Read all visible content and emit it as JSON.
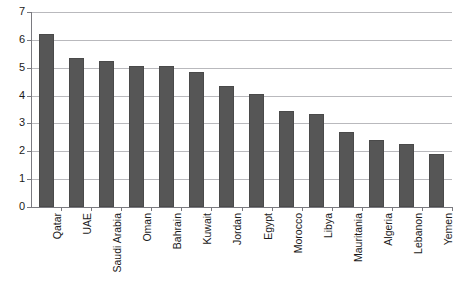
{
  "chart_data": {
    "type": "bar",
    "title": "",
    "xlabel": "",
    "ylabel": "",
    "ylim": [
      0,
      7
    ],
    "yticks": [
      0,
      1,
      2,
      3,
      4,
      5,
      6,
      7
    ],
    "grid": true,
    "legend": false,
    "orientation": "vertical",
    "bar_color": "#565656",
    "gridline_color": "#b9b9bd",
    "axis_color": "#7a7a80",
    "categories": [
      "Qatar",
      "UAE",
      "Saudi Arabia",
      "Oman",
      "Bahrain",
      "Kuwait",
      "Jordan",
      "Egypt",
      "Morocco",
      "Libya",
      "Mauritania",
      "Algeria",
      "Lebanon",
      "Yemen"
    ],
    "values": [
      6.2,
      5.35,
      5.25,
      5.05,
      5.05,
      4.85,
      4.35,
      4.05,
      3.45,
      3.35,
      2.7,
      2.4,
      2.25,
      1.9
    ]
  }
}
